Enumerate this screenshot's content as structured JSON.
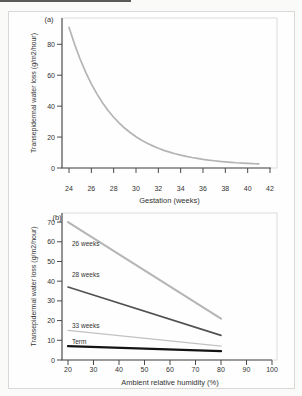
{
  "figure": {
    "text_color": "#333333",
    "axis_color": "#4a4a4a",
    "frame_color": "#dcdcdc",
    "card_border_color": "#d8d8d8",
    "scan_line_color": "#5a5a5a"
  },
  "chart_data": [
    {
      "type": "line",
      "panel_label": "(a)",
      "title": "",
      "xlabel": "Gestation (weeks)",
      "ylabel": "Transepidermal water loss (g/m2/hour)",
      "xlim": [
        24,
        42
      ],
      "ylim": [
        0,
        97
      ],
      "xticks": [
        24,
        26,
        28,
        30,
        32,
        34,
        36,
        38,
        40,
        42
      ],
      "yticks": [
        0,
        20,
        40,
        60,
        80
      ],
      "grid": false,
      "legend_position": "none",
      "series": [
        {
          "name": "TEWL vs gestation",
          "color": "#b4b4b4",
          "width": 1.7,
          "label": "",
          "x": [
            24,
            24.5,
            25,
            25.5,
            26,
            26.5,
            27,
            27.5,
            28,
            28.5,
            29,
            29.5,
            30,
            30.5,
            31,
            31.5,
            32,
            32.5,
            33,
            33.5,
            34,
            34.5,
            35,
            35.5,
            36,
            36.5,
            37,
            37.5,
            38,
            38.5,
            39,
            39.5,
            40,
            40.5,
            41
          ],
          "y": [
            91,
            80,
            70.3,
            61.8,
            54.4,
            47.9,
            42.2,
            37.2,
            32.8,
            29,
            25.7,
            22.8,
            20.2,
            18,
            16,
            14.3,
            12.8,
            11.4,
            10.3,
            9.2,
            8.3,
            7.5,
            6.8,
            6.2,
            5.6,
            5.1,
            4.7,
            4.3,
            4,
            3.7,
            3.4,
            3.2,
            3,
            2.8,
            2.7
          ]
        }
      ]
    },
    {
      "type": "line",
      "panel_label": "(b)",
      "title": "",
      "xlabel": "Ambient relative humidity (%)",
      "ylabel": "Transepidermal water loss (g/m2/hour)",
      "xlim": [
        20,
        100
      ],
      "ylim": [
        0,
        74.6
      ],
      "xticks": [
        20,
        30,
        40,
        50,
        60,
        70,
        80,
        90,
        100
      ],
      "yticks": [
        0,
        10,
        20,
        30,
        40,
        50,
        60,
        70
      ],
      "grid": false,
      "legend_position": "inline-labels",
      "series": [
        {
          "name": "26 weeks",
          "color": "#b5b5b5",
          "width": 2,
          "label": "26 weeks",
          "x": [
            20,
            80
          ],
          "y": [
            70,
            21
          ]
        },
        {
          "name": "28 weeks",
          "color": "#525252",
          "width": 1.6,
          "label": "28 weeks",
          "x": [
            20,
            80
          ],
          "y": [
            37,
            12.5
          ]
        },
        {
          "name": "33 weeks",
          "color": "#c2c2c2",
          "width": 1.2,
          "label": "33 weeks",
          "x": [
            20,
            80
          ],
          "y": [
            15,
            7
          ]
        },
        {
          "name": "Term",
          "color": "#141414",
          "width": 2.3,
          "label": "Term",
          "x": [
            20,
            80
          ],
          "y": [
            7,
            4.5
          ]
        }
      ]
    }
  ]
}
